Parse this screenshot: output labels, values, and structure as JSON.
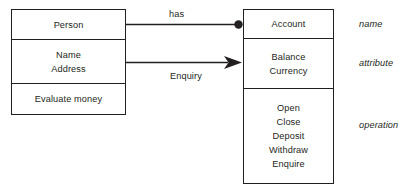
{
  "diagram": {
    "type": "uml-class-diagram",
    "stroke_color": "#231f20",
    "background_color": "#ffffff",
    "classes": [
      {
        "id": "person",
        "name": "Person",
        "attributes": [
          "Name",
          "Address"
        ],
        "operations": [
          "Evaluate money"
        ]
      },
      {
        "id": "account",
        "name": "Account",
        "attributes": [
          "Balance",
          "Currency"
        ],
        "operations": [
          "Open",
          "Close",
          "Deposit",
          "Withdraw",
          "Enquire"
        ]
      }
    ],
    "connectors": [
      {
        "id": "has",
        "label": "has",
        "from": "person",
        "to": "account",
        "end_marker": "filled-circle"
      },
      {
        "id": "enquiry",
        "label": "Enquiry",
        "from": "person",
        "to": "account",
        "end_marker": "filled-arrow"
      }
    ],
    "annotations": [
      {
        "id": "name",
        "label": "name"
      },
      {
        "id": "attribute",
        "label": "attribute"
      },
      {
        "id": "operation",
        "label": "operation"
      }
    ]
  }
}
